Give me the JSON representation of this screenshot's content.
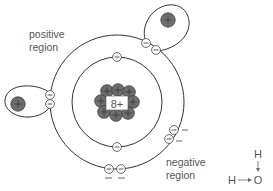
{
  "diagram": {
    "colors": {
      "line": "#333333",
      "proton_fill": "#6e6e6e",
      "proton_stroke": "#3a3a3a",
      "electron_fill": "#ffffff",
      "text": "#555555",
      "background": "#ffffff"
    },
    "labels": {
      "positive_region": [
        "positive",
        "region"
      ],
      "negative_region": [
        "negative",
        "region"
      ]
    },
    "nucleus": {
      "label": "8+",
      "protons": 8,
      "center": [
        117,
        102
      ]
    },
    "orbits": {
      "inner": {
        "center": [
          117,
          102
        ],
        "radius": 45,
        "electrons": 2
      },
      "outer": {
        "center": [
          117,
          102
        ],
        "radius": 67,
        "electrons": 8
      }
    },
    "electron_symbol": "−",
    "proton_symbol": "+",
    "hydrogens": [
      {
        "name": "hydrogen-left",
        "proton": [
          18,
          104
        ]
      },
      {
        "name": "hydrogen-top-right",
        "proton": [
          168,
          20
        ]
      }
    ],
    "lone_pair_marks": [
      "−",
      "−",
      "−",
      "−"
    ],
    "legend_formula": {
      "top_atom": "H",
      "left_atom": "H",
      "center_atom": "O"
    }
  }
}
